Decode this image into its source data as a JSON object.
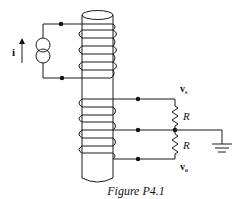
{
  "figure": {
    "caption": "Figure P4.1",
    "type": "circuit-diagram"
  },
  "labels": {
    "current": "i",
    "v_top_main": "v",
    "v_top_sub": "s",
    "v_bottom_main": "v",
    "v_bottom_sub": "o",
    "resistor_top": "R",
    "resistor_bottom": "R"
  },
  "components": {
    "source": "current-source",
    "core": "cylindrical-core",
    "primary_coil_turns": 3,
    "secondary_coil_turns": 4,
    "resistors": [
      "R",
      "R"
    ],
    "ground": "ground"
  },
  "colors": {
    "line": "#1a1a1a",
    "background": "#ffffff"
  }
}
